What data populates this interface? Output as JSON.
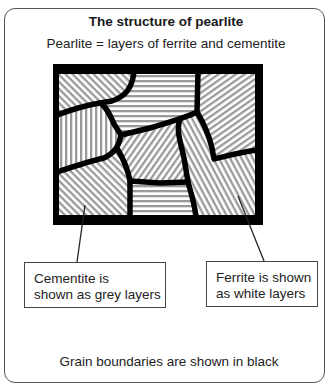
{
  "figure": {
    "title": "The structure of pearlite",
    "subtitle": "Pearlite = layers of ferrite and cementite",
    "labels": {
      "cementite": {
        "line1": "Cementite is",
        "line2": "shown as grey layers"
      },
      "ferrite": {
        "line1": "Ferrite is shown",
        "line2": "as white layers"
      }
    },
    "footer": "Grain boundaries are shown in black",
    "colors": {
      "cementite_layer": "#9a9a9a",
      "ferrite_layer": "#ffffff",
      "grain_boundary": "#000000",
      "panel_border": "#555555"
    },
    "grains": [
      {
        "name": "top-left",
        "stripe_orientation": "diagonal-down"
      },
      {
        "name": "top-center",
        "stripe_orientation": "horizontal"
      },
      {
        "name": "top-right",
        "stripe_orientation": "diagonal-up"
      },
      {
        "name": "left-middle",
        "stripe_orientation": "vertical"
      },
      {
        "name": "center",
        "stripe_orientation": "diagonal-up-steep"
      },
      {
        "name": "right-middle",
        "stripe_orientation": "diagonal-down-steep"
      },
      {
        "name": "bottom-left",
        "stripe_orientation": "diagonal-down"
      },
      {
        "name": "bottom-center",
        "stripe_orientation": "horizontal"
      }
    ]
  }
}
